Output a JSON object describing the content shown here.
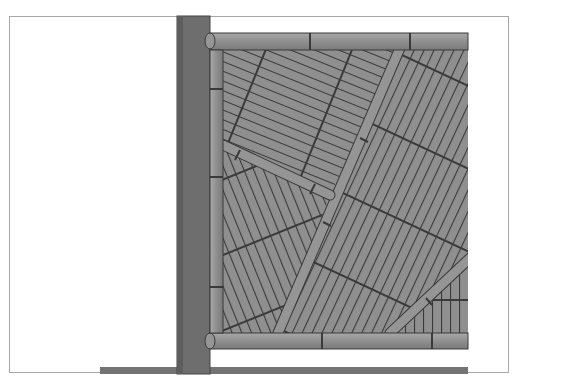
{
  "figure": {
    "colors": {
      "background": "#ffffff",
      "frame_border": "#a8a8a8",
      "post": "#6e6e6e",
      "post_shade": "#555555",
      "bamboo": "#8f8f8f",
      "bamboo_light": "#a3a3a3",
      "outline": "#3a3a3a",
      "ground": "#747474"
    },
    "parts": {
      "post": "Vertical wooden post",
      "top_rail": "Horizontal bamboo top rail",
      "bottom_rail": "Horizontal bamboo bottom rail",
      "side_rail": "Vertical bamboo side rail",
      "infill": "Diagonal bamboo infill sections",
      "ground": "Ground line"
    }
  }
}
